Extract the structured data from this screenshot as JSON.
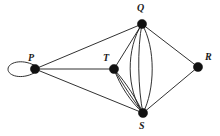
{
  "figure": {
    "width": 220,
    "height": 136,
    "background_color": "#ffffff",
    "stroke_color": "#1a1a1a",
    "vertex_color": "#111111"
  },
  "vertices": [
    {
      "id": "P",
      "label": "P",
      "x": 35,
      "y": 69,
      "radius": 4.6,
      "label_x": 28,
      "label_y": 53,
      "degree": 5
    },
    {
      "id": "Q",
      "label": "Q",
      "x": 142,
      "y": 24,
      "radius": 4.6,
      "label_x": 137,
      "label_y": 3,
      "degree": 6
    },
    {
      "id": "T",
      "label": "T",
      "x": 114,
      "y": 69,
      "radius": 4.6,
      "label_x": 103,
      "label_y": 53,
      "degree": 5
    },
    {
      "id": "S",
      "label": "S",
      "x": 143,
      "y": 113,
      "radius": 4.6,
      "label_x": 139,
      "label_y": 121,
      "degree": 9
    },
    {
      "id": "R",
      "label": "R",
      "x": 198,
      "y": 67,
      "radius": 4.6,
      "label_x": 205,
      "label_y": 52,
      "degree": 2
    }
  ],
  "edges": [
    {
      "id": "loop-P",
      "from": "P",
      "to": "P",
      "kind": "self-loop",
      "multiplicity": 1
    },
    {
      "id": "P-Q",
      "from": "P",
      "to": "Q",
      "kind": "straight",
      "multiplicity": 1
    },
    {
      "id": "P-T",
      "from": "P",
      "to": "T",
      "kind": "straight",
      "multiplicity": 1
    },
    {
      "id": "P-S",
      "from": "P",
      "to": "S",
      "kind": "straight",
      "multiplicity": 1
    },
    {
      "id": "Q-T",
      "from": "Q",
      "to": "T",
      "kind": "straight",
      "multiplicity": 1
    },
    {
      "id": "Q-R",
      "from": "Q",
      "to": "R",
      "kind": "straight",
      "multiplicity": 1
    },
    {
      "id": "R-S",
      "from": "R",
      "to": "S",
      "kind": "straight",
      "multiplicity": 1
    },
    {
      "id": "Q-S",
      "from": "Q",
      "to": "S",
      "kind": "curved-bundle",
      "multiplicity": 3
    },
    {
      "id": "T-S",
      "from": "T",
      "to": "S",
      "kind": "curved-bundle",
      "multiplicity": 3
    }
  ]
}
